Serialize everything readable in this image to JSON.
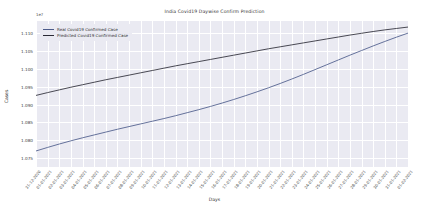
{
  "chart_data": {
    "type": "line",
    "title": "India Covid19 Daywise Confirm Prediction",
    "xlabel": "Days",
    "ylabel": "Cases",
    "offset_text": "1e7",
    "grid": true,
    "legend_position": "upper left",
    "ylim": [
      1.0725,
      1.1135
    ],
    "yticks": [
      1.075,
      1.08,
      1.085,
      1.09,
      1.095,
      1.1,
      1.105,
      1.11
    ],
    "ytick_labels": [
      "1.075",
      "1.080",
      "1.085",
      "1.090",
      "1.095",
      "1.100",
      "1.105",
      "1.110"
    ],
    "categories": [
      "31-12-2020",
      "01-01-2021",
      "02-01-2021",
      "03-01-2021",
      "04-01-2021",
      "05-01-2021",
      "06-01-2021",
      "07-01-2021",
      "08-01-2021",
      "09-01-2021",
      "10-01-2021",
      "11-01-2021",
      "12-01-2021",
      "13-01-2021",
      "14-01-2021",
      "15-01-2021",
      "16-01-2021",
      "17-01-2021",
      "18-01-2021",
      "19-01-2021",
      "20-01-2021",
      "21-01-2021",
      "22-01-2021",
      "23-01-2021",
      "24-01-2021",
      "25-01-2021",
      "26-01-2021",
      "27-01-2021",
      "28-01-2021",
      "29-01-2021",
      "30-01-2021",
      "31-01-2021",
      "01-02-2021"
    ],
    "series": [
      {
        "name": "Real Covid19 Confirmed Case",
        "color": "#4c5b8a",
        "values": [
          1.077,
          1.078,
          1.07895,
          1.07985,
          1.0807,
          1.0815,
          1.0823,
          1.0831,
          1.08385,
          1.0846,
          1.08535,
          1.0861,
          1.0869,
          1.08775,
          1.0886,
          1.0895,
          1.09045,
          1.09145,
          1.0925,
          1.0936,
          1.09475,
          1.09595,
          1.0972,
          1.0985,
          1.09985,
          1.1012,
          1.10255,
          1.1039,
          1.1052,
          1.1065,
          1.10775,
          1.10895,
          1.1101
        ]
      },
      {
        "name": "Predicted Covid19 Confirmed Case",
        "color": "#2a2a35",
        "values": [
          1.0926,
          1.0934,
          1.09415,
          1.0949,
          1.0956,
          1.0963,
          1.097,
          1.09765,
          1.0983,
          1.09895,
          1.0996,
          1.10025,
          1.1009,
          1.1015,
          1.1021,
          1.1027,
          1.1033,
          1.1039,
          1.1045,
          1.1051,
          1.1057,
          1.10625,
          1.1068,
          1.10735,
          1.1079,
          1.10845,
          1.109,
          1.10955,
          1.11005,
          1.11055,
          1.111,
          1.1114,
          1.1118
        ]
      }
    ]
  }
}
